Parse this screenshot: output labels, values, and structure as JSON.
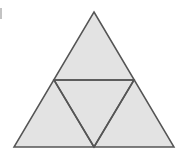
{
  "figure": {
    "canvas": {
      "width": 186,
      "height": 155
    },
    "colors": {
      "background": "#ffffff",
      "fill": "#e3e3e3",
      "stroke": "#555555",
      "artifact": "#b9b9b9"
    },
    "stroke_width": 1.5,
    "vertices": {
      "apex": {
        "label": "apex",
        "x": 94,
        "y": 12
      },
      "bottom_left": {
        "label": "bottom-left",
        "x": 14,
        "y": 147
      },
      "bottom_right": {
        "label": "bottom-right",
        "x": 174,
        "y": 147
      },
      "midpoint_left": {
        "label": "left-midpoint",
        "x": 54,
        "y": 80
      },
      "midpoint_right": {
        "label": "right-midpoint",
        "x": 134,
        "y": 80
      },
      "midpoint_base": {
        "label": "base-midpoint",
        "x": 94,
        "y": 147
      }
    },
    "paths": {
      "outer_triangle": "94,12 174,147 14,147",
      "inner_inverted_triangle": "54,80 134,80 94,147",
      "midsegment_horizontal": {
        "x1": 54,
        "y1": 80,
        "x2": 134,
        "y2": 80
      },
      "midsegment_left": {
        "x1": 54,
        "y1": 80,
        "x2": 94,
        "y2": 147
      },
      "midsegment_right": {
        "x1": 134,
        "y1": 80,
        "x2": 94,
        "y2": 147
      }
    },
    "artifact": {
      "label": "left-edge-mark",
      "x": 0,
      "y": 8,
      "width": 2,
      "height": 11
    }
  }
}
